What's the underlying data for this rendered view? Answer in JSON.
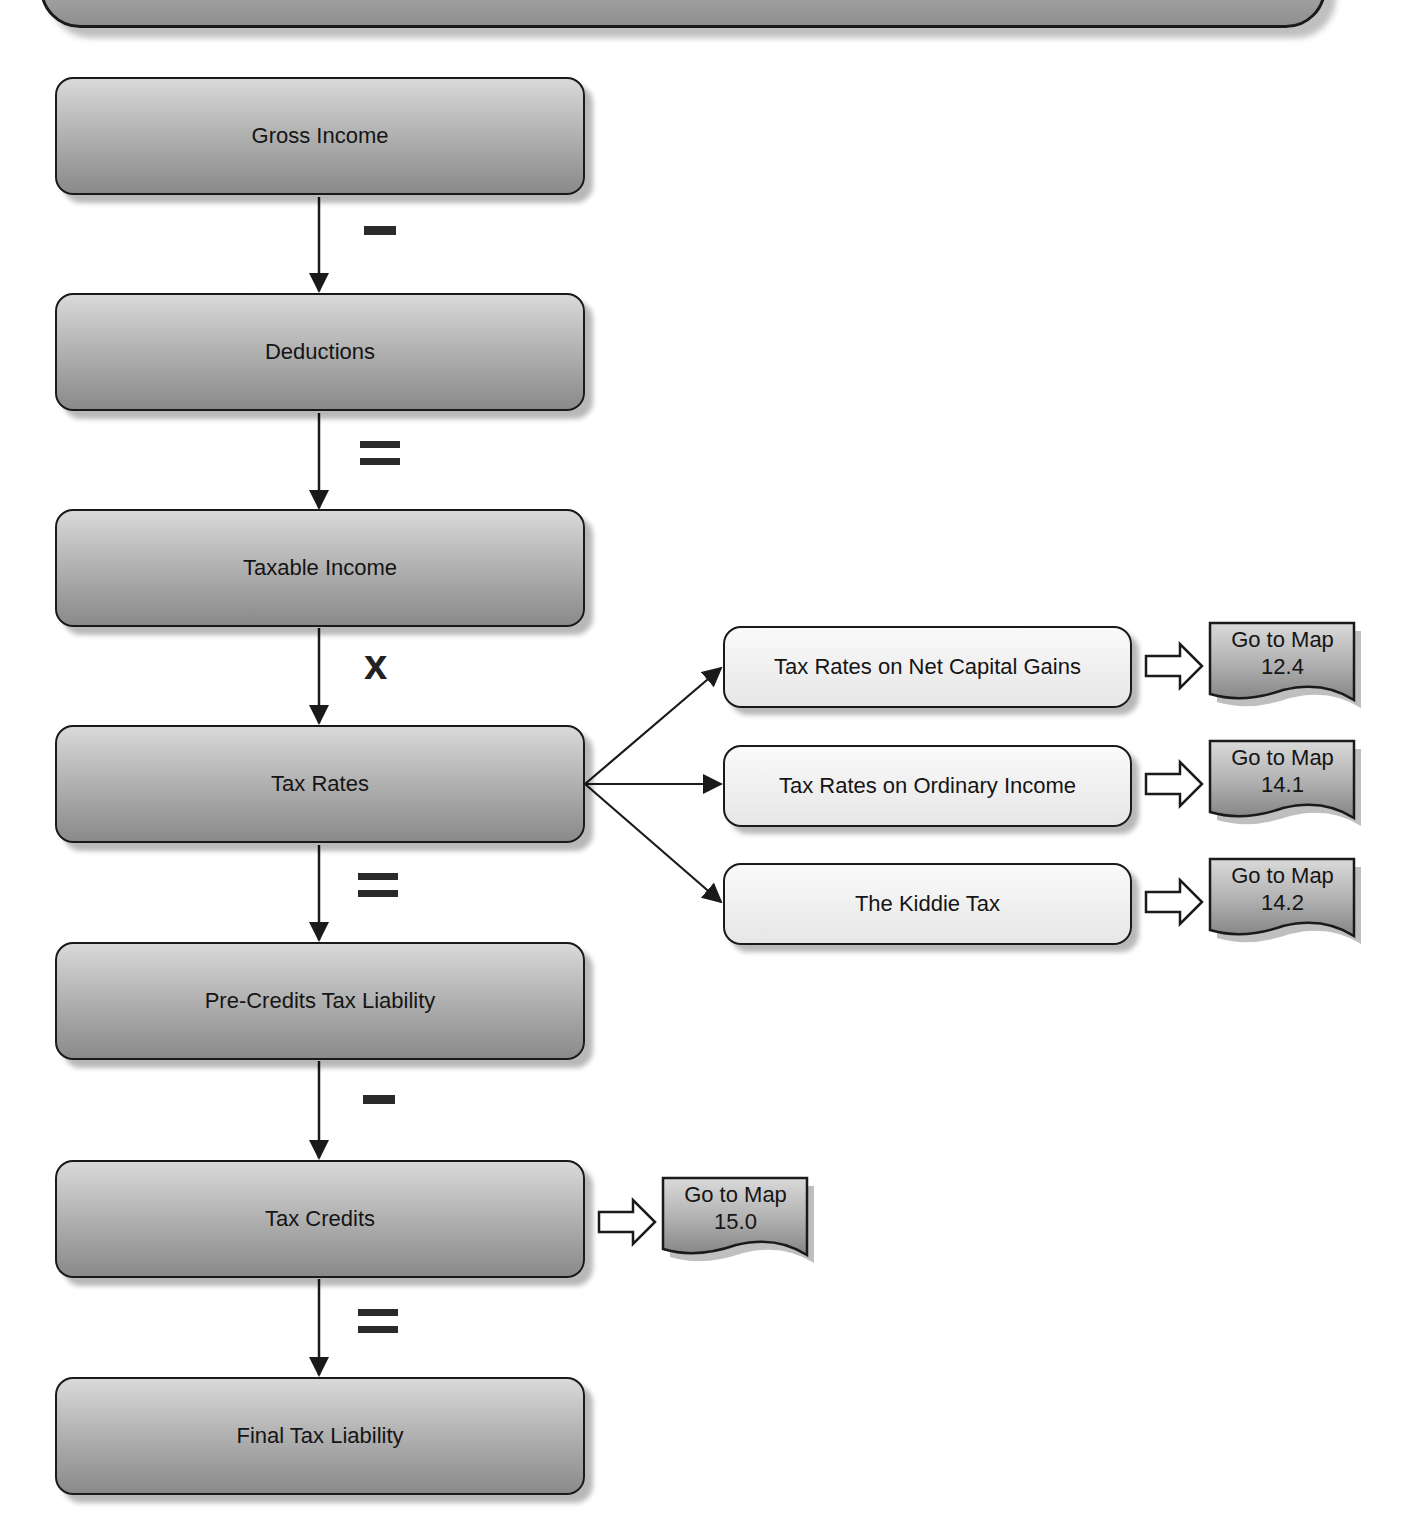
{
  "diagram": {
    "title_banner": "",
    "main_flow": [
      {
        "id": "gross-income",
        "label": "Gross Income"
      },
      {
        "id": "deductions",
        "label": "Deductions"
      },
      {
        "id": "taxable-income",
        "label": "Taxable Income"
      },
      {
        "id": "tax-rates",
        "label": "Tax Rates"
      },
      {
        "id": "pre-credits-tax-liability",
        "label": "Pre-Credits Tax Liability"
      },
      {
        "id": "tax-credits",
        "label": "Tax Credits"
      },
      {
        "id": "final-tax-liability",
        "label": "Final Tax Liability"
      }
    ],
    "operators": [
      {
        "between": [
          "Gross Income",
          "Deductions"
        ],
        "symbol": "−"
      },
      {
        "between": [
          "Deductions",
          "Taxable Income"
        ],
        "symbol": "="
      },
      {
        "between": [
          "Taxable Income",
          "Tax Rates"
        ],
        "symbol": "x"
      },
      {
        "between": [
          "Tax Rates",
          "Pre-Credits Tax Liability"
        ],
        "symbol": "="
      },
      {
        "between": [
          "Pre-Credits Tax Liability",
          "Tax Credits"
        ],
        "symbol": "−"
      },
      {
        "between": [
          "Tax Credits",
          "Final Tax Liability"
        ],
        "symbol": "="
      }
    ],
    "tax_rate_branches": [
      {
        "label": "Tax Rates on Net Capital Gains",
        "map_ref": {
          "line1": "Go to Map",
          "line2": "12.4"
        }
      },
      {
        "label": "Tax Rates on Ordinary Income",
        "map_ref": {
          "line1": "Go to Map",
          "line2": "14.1"
        }
      },
      {
        "label": "The Kiddie Tax",
        "map_ref": {
          "line1": "Go to Map",
          "line2": "14.2"
        }
      }
    ],
    "tax_credits_ref": {
      "line1": "Go to Map",
      "line2": "15.0"
    }
  }
}
